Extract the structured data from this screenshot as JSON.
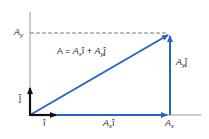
{
  "diagram": {
    "equation": {
      "lhs": "A",
      "eq": " = ",
      "t1_mag": "A",
      "t1_sub": "x",
      "t1_unit": "î",
      "plus": " + ",
      "t2_mag": "A",
      "t2_sub": "y",
      "t2_unit": "ĵ"
    },
    "labels": {
      "ay_axis": {
        "mag": "A",
        "sub": "y"
      },
      "ax_axis": {
        "mag": "A",
        "sub": "x"
      },
      "ax_vec": {
        "mag": "A",
        "sub": "x",
        "unit": "î"
      },
      "ay_vec": {
        "mag": "A",
        "sub": "y",
        "unit": "ĵ"
      },
      "i_hat": "î",
      "j_hat": "ĵ"
    },
    "colors": {
      "vector": "#2a63c4",
      "axis": "#9a9a9a",
      "unit": "#111111",
      "dash": "#555555"
    }
  }
}
